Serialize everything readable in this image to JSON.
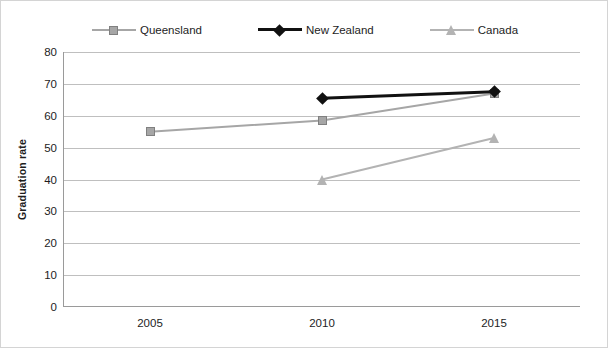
{
  "chart_data": {
    "type": "line",
    "title": "",
    "xlabel": "",
    "ylabel": "Graduation rate",
    "categories": [
      "2005",
      "2010",
      "2015"
    ],
    "x": [
      2005,
      2010,
      2015
    ],
    "ylim": [
      0,
      80
    ],
    "yticks": [
      80,
      70,
      60,
      50,
      40,
      30,
      20,
      10,
      0
    ],
    "grid": true,
    "legend_position": "top",
    "series": [
      {
        "name": "Queensland",
        "color": "#a6a6a6",
        "marker": "square",
        "values": [
          55,
          58.5,
          67
        ]
      },
      {
        "name": "New Zealand",
        "color": "#111111",
        "marker": "diamond",
        "values": [
          null,
          65.5,
          67.5
        ]
      },
      {
        "name": "Canada",
        "color": "#b3b3b3",
        "marker": "triangle",
        "values": [
          null,
          40,
          53
        ]
      }
    ]
  },
  "legend": {
    "items": [
      {
        "label": "Queensland",
        "marker": "square-marker-icon"
      },
      {
        "label": "New Zealand",
        "marker": "diamond-marker-icon"
      },
      {
        "label": "Canada",
        "marker": "triangle-marker-icon"
      }
    ]
  },
  "axes": {
    "y_title": "Graduation rate",
    "y_labels": [
      "80",
      "70",
      "60",
      "50",
      "40",
      "30",
      "20",
      "10",
      "0"
    ],
    "x_labels": [
      "2005",
      "2010",
      "2015"
    ]
  },
  "colors": {
    "queensland": "#a6a6a6",
    "new_zealand": "#111111",
    "canada": "#b3b3b3",
    "gridline": "#bfbfbf",
    "axis": "#9a9a9a",
    "text": "#1d1d1d",
    "border": "#d4d4d4"
  }
}
